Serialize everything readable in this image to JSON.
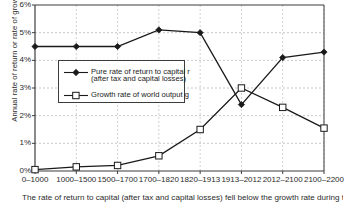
{
  "chart_data": {
    "type": "line",
    "title": "",
    "xlabel": "",
    "ylabel": "Annual rate of return or rate of growth",
    "categories": [
      "0–1000",
      "1000–1500",
      "1500–1700",
      "1700–1820",
      "1820–1913",
      "1913–2012",
      "2012–2100",
      "2100–2200"
    ],
    "series": [
      {
        "name": "Pure rate of return to capital r (after tax and capital losses)",
        "marker": "filled-diamond",
        "values": [
          4.5,
          4.5,
          4.5,
          5.1,
          5.0,
          2.4,
          4.1,
          4.3
        ]
      },
      {
        "name": "Growth rate of world output g",
        "marker": "open-square",
        "values": [
          0.05,
          0.15,
          0.2,
          0.55,
          1.5,
          3.0,
          2.3,
          1.55
        ]
      }
    ],
    "ylim": [
      0,
      6
    ],
    "yticks": [
      "0%",
      "1%",
      "2%",
      "3%",
      "4%",
      "5%",
      "6%"
    ],
    "ytick_values": [
      0,
      1,
      2,
      3,
      4,
      5,
      6
    ],
    "grid": true,
    "legend_position": "inside-upper-left"
  },
  "legend": {
    "entry_r_line1": "Pure rate of return to capital r",
    "entry_r_line2": "(after tax and capital losses)",
    "entry_g": "Growth rate of world output g"
  },
  "caption": {
    "text": "The rate of return to capital (after tax and capital losses) fell below the growth rate during the"
  },
  "colors": {
    "series_r": "#1a1a1a",
    "series_g": "#1a1a1a",
    "grid": "#b9b9b9",
    "axis": "#3d3d3d",
    "background": "#ffffff"
  }
}
